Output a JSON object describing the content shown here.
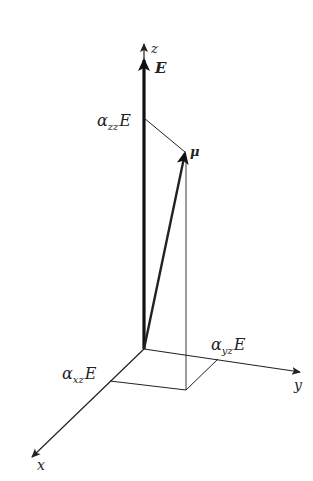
{
  "diagram": {
    "axes": {
      "z": "z",
      "y": "y",
      "x": "x"
    },
    "vectors": {
      "field": "E",
      "dipole": "μ"
    },
    "components": {
      "zz": {
        "alpha": "α",
        "sub": "zz",
        "field": "E"
      },
      "yz": {
        "alpha": "α",
        "sub": "yz",
        "field": "E"
      },
      "xz": {
        "alpha": "α",
        "sub": "xz",
        "field": "E"
      }
    },
    "colors": {
      "ink": "#222222",
      "background": "#ffffff"
    }
  }
}
